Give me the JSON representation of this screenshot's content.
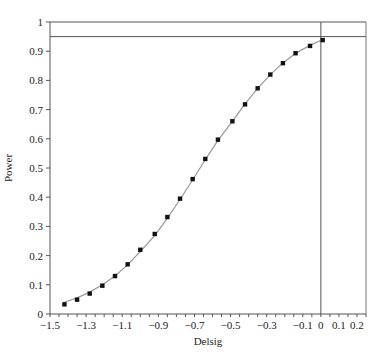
{
  "chart_data": {
    "type": "scatter",
    "title": "",
    "xlabel": "Delsig",
    "ylabel": "Power",
    "xlim": [
      -1.5,
      0.25
    ],
    "ylim": [
      0,
      1
    ],
    "x_ticks": [
      -1.5,
      -1.3,
      -1.1,
      -0.9,
      -0.7,
      -0.5,
      -0.3,
      -0.1,
      0,
      0.1,
      0.2
    ],
    "x_tick_labels": [
      "−1.5",
      "−1.3",
      "−1.1",
      "−0.9",
      "−0.7",
      "−0.5",
      "−0.3",
      "−0.1",
      "0",
      "0.1",
      "0.2"
    ],
    "y_ticks": [
      0,
      0.1,
      0.2,
      0.3,
      0.4,
      0.5,
      0.6,
      0.7,
      0.8,
      0.9,
      1
    ],
    "y_tick_labels": [
      "0",
      "0.1",
      "0.2",
      "0.3",
      "0.4",
      "0.5",
      "0.6",
      "0.7",
      "0.8",
      "0.9",
      "1"
    ],
    "grid": false,
    "reference_lines": {
      "horizontal": [
        0.95,
        1.0
      ],
      "vertical": [
        0
      ]
    },
    "series": [
      {
        "name": "Simulated power (points)",
        "style": "markers",
        "x": [
          -1.42,
          -1.35,
          -1.28,
          -1.21,
          -1.14,
          -1.07,
          -1.0,
          -0.92,
          -0.85,
          -0.78,
          -0.71,
          -0.64,
          -0.57,
          -0.49,
          -0.42,
          -0.35,
          -0.28,
          -0.21,
          -0.14,
          -0.06,
          0.01
        ],
        "values": [
          0.033,
          0.049,
          0.07,
          0.097,
          0.13,
          0.17,
          0.22,
          0.274,
          0.332,
          0.395,
          0.462,
          0.531,
          0.597,
          0.66,
          0.718,
          0.773,
          0.82,
          0.859,
          0.893,
          0.918,
          0.938
        ]
      },
      {
        "name": "Theoretical power (curve)",
        "style": "line",
        "x": [
          -1.42,
          -1.35,
          -1.28,
          -1.21,
          -1.14,
          -1.07,
          -1.0,
          -0.92,
          -0.85,
          -0.78,
          -0.71,
          -0.64,
          -0.57,
          -0.49,
          -0.42,
          -0.35,
          -0.28,
          -0.21,
          -0.14,
          -0.06,
          0.01
        ],
        "values": [
          0.04,
          0.055,
          0.075,
          0.1,
          0.13,
          0.168,
          0.214,
          0.268,
          0.328,
          0.392,
          0.46,
          0.528,
          0.595,
          0.66,
          0.72,
          0.773,
          0.82,
          0.86,
          0.893,
          0.92,
          0.94
        ]
      }
    ]
  }
}
